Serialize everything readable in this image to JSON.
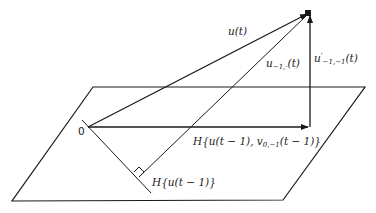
{
  "diagram": {
    "type": "vector-projection",
    "plane": {
      "points": [
        [
          93,
          87
        ],
        [
          365,
          87
        ],
        [
          283,
          200
        ],
        [
          12,
          201
        ]
      ]
    },
    "origin": {
      "label": "0",
      "point": [
        88,
        127
      ]
    },
    "apex": [
      309,
      13
    ],
    "vectors": {
      "u_t": {
        "label": "u(t)",
        "from": [
          88,
          127
        ],
        "to": [
          309,
          13
        ]
      },
      "u_minus": {
        "label_main": "u",
        "label_sub": "−1,·",
        "label_tail": "(t)",
        "from": [
          139,
          177
        ],
        "to": [
          309,
          13
        ]
      },
      "projection": {
        "label": "H{u(t − 1), v",
        "label_sub": "0,−1",
        "label_tail": "(t − 1)}",
        "from": [
          88,
          127
        ],
        "to": [
          310,
          127
        ]
      },
      "residual": {
        "label_main": "u",
        "label_sup": "′",
        "label_sub": "−1,−1",
        "label_tail": "(t)",
        "from": [
          310,
          127
        ],
        "to": [
          310,
          13
        ]
      }
    },
    "subspace_line": {
      "label": "H{u(t − 1)}",
      "from": [
        82,
        120
      ],
      "to": [
        151,
        193
      ]
    },
    "right_angle_at": [
      139,
      177
    ],
    "line_color": "#1a1a1a"
  }
}
